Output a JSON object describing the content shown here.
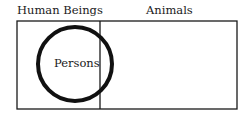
{
  "diagram": {
    "type": "euler-diagram",
    "regions": [
      {
        "label": "Human Beings"
      },
      {
        "label": "Animals"
      }
    ],
    "circle": {
      "label": "Persons"
    }
  }
}
